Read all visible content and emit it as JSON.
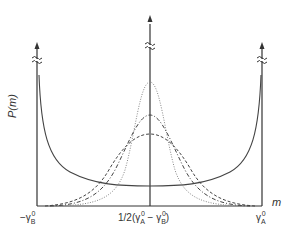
{
  "figure": {
    "y_axis_label": "P(m)",
    "x_axis_label": "m",
    "tick_left": {
      "prefix": "−",
      "symbol": "γ",
      "sub": "B",
      "sup": "0"
    },
    "tick_center": {
      "prefix": "1/2(",
      "a_symbol": "γ",
      "a_sub": "A",
      "a_sup": "0",
      "minus": " − ",
      "b_symbol": "γ",
      "b_sub": "B",
      "b_sup": "0",
      "suffix": ")"
    },
    "tick_right": {
      "symbol": "γ",
      "sub": "A",
      "sup": "0"
    },
    "break_symbol": "≈",
    "colors": {
      "axis": "#333333",
      "solid": "#444444",
      "dashed": "#444444",
      "dotted": "#888888"
    }
  },
  "curves": [
    {
      "name": "U-shaped solid",
      "style": "solid",
      "description": "diverges at both edges, minimum in center"
    },
    {
      "name": "broad dashed",
      "style": "dashed",
      "peak_relative": 0.45
    },
    {
      "name": "medium dash-dot",
      "style": "dash-dot",
      "peak_relative": 0.6
    },
    {
      "name": "narrow dotted",
      "style": "dotted",
      "peak_relative": 0.85
    }
  ]
}
